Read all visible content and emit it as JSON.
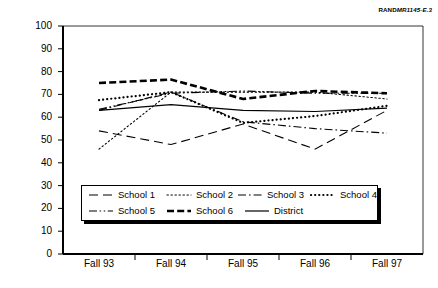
{
  "figure_id": {
    "rand": "RAND",
    "number": "MR1145-E.3"
  },
  "chart_data": {
    "type": "line",
    "title": "",
    "xlabel": "",
    "ylabel": "Median percentile rank (CTBS)",
    "categories": [
      "Fall 93",
      "Fall 94",
      "Fall 95",
      "Fall 96",
      "Fall 97"
    ],
    "ylim": [
      0,
      100
    ],
    "yticks": [
      0,
      10,
      20,
      30,
      40,
      50,
      60,
      70,
      80,
      90,
      100
    ],
    "grid": false,
    "legend_position": "inside-bottom-center",
    "series": [
      {
        "name": "School 1",
        "values": [
          54,
          48,
          57,
          46,
          63
        ],
        "style": "long-dash",
        "width": 1.1
      },
      {
        "name": "School 2",
        "values": [
          46,
          71,
          71,
          71,
          68
        ],
        "style": "dotted-fine",
        "width": 1.1
      },
      {
        "name": "School 3",
        "values": [
          63,
          71,
          58,
          55,
          53
        ],
        "style": "dash-dot",
        "width": 1.1
      },
      {
        "name": "School 4",
        "values": [
          67.5,
          71,
          57.5,
          60.5,
          65
        ],
        "style": "dotted-bold",
        "width": 2.2
      },
      {
        "name": "School 5",
        "values": [
          63.5,
          70.5,
          71.5,
          70.5,
          70.5
        ],
        "style": "dash-dot-dot",
        "width": 1.1
      },
      {
        "name": "School 6",
        "values": [
          75,
          76.5,
          68,
          71.5,
          70.5
        ],
        "style": "thick-dash",
        "width": 2.6
      },
      {
        "name": "District",
        "values": [
          63,
          65.5,
          63,
          62.5,
          64
        ],
        "style": "solid",
        "width": 1.2
      }
    ]
  },
  "legend": {
    "rows": [
      [
        {
          "label": "School 1",
          "series": 0
        },
        {
          "label": "School 2",
          "series": 1
        },
        {
          "label": "School 3",
          "series": 2
        },
        {
          "label": "School 4",
          "series": 3
        }
      ],
      [
        {
          "label": "School 5",
          "series": 4
        },
        {
          "label": "School 6",
          "series": 5
        },
        {
          "label": "District",
          "series": 6
        }
      ]
    ]
  }
}
